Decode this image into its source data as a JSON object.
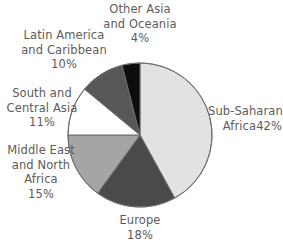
{
  "chart_data": {
    "type": "pie",
    "title": "",
    "subtitle": "",
    "xlabel": "",
    "ylabel": "",
    "legend_position": "none",
    "grid": false,
    "start_angle_deg": 0,
    "direction": "clockwise",
    "categories": [
      "Sub-Saharan Africa",
      "Europe",
      "Middle East and North Africa",
      "South and Central Asia",
      "Latin America and Caribbean",
      "Other Asia and Oceania"
    ],
    "values": [
      42,
      18,
      15,
      11,
      10,
      4
    ],
    "value_unit": "%",
    "slices": [
      {
        "name": "Sub-Saharan Africa",
        "value": 42,
        "value_text": "42%",
        "color": "#e2e2e2"
      },
      {
        "name": "Europe",
        "value": 18,
        "value_text": "18%",
        "color": "#4a4a4a"
      },
      {
        "name": "Middle East and North Africa",
        "value": 15,
        "value_text": "15%",
        "color": "#a5a5a5"
      },
      {
        "name": "South and Central Asia",
        "value": 11,
        "value_text": "11%",
        "color": "#ffffff"
      },
      {
        "name": "Latin America and Caribbean",
        "value": 10,
        "value_text": "10%",
        "color": "#575757"
      },
      {
        "name": "Other Asia and Oceania",
        "value": 4,
        "value_text": "4%",
        "color": "#0d0d0d"
      }
    ]
  },
  "labels": {
    "other_asia": {
      "line1": "Other Asia",
      "line2": "and Oceania",
      "line3": "4%"
    },
    "latin_america": {
      "line1": "Latin America",
      "line2": "and Caribbean",
      "line3": "10%"
    },
    "south_central": {
      "line1": "South and",
      "line2": "Central Asia",
      "line3": "11%"
    },
    "middle_east": {
      "line1": "Middle East",
      "line2": "and North",
      "line3": "Africa",
      "line4": "15%"
    },
    "europe": {
      "line1": "Europe",
      "line2": "18%"
    },
    "sub_saharan": {
      "line1": "Sub-Saharan",
      "line2": "Africa42%"
    }
  },
  "style": {
    "text_color": "#5c5c5c",
    "outline_color": "#6e6e6e",
    "background": "#ffffff"
  }
}
